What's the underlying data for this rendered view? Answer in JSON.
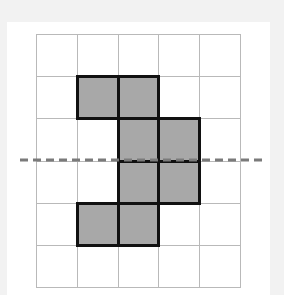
{
  "diagram": {
    "type": "grid-figure-with-symmetry-line",
    "grid": {
      "rows": 6,
      "cols": 5,
      "left": 36,
      "top": 34,
      "cell_width": 40.8,
      "cell_height": 42.2,
      "line_color": "#b9b9b9"
    },
    "shaded_cells": [
      {
        "row": 1,
        "col": 1
      },
      {
        "row": 1,
        "col": 2
      },
      {
        "row": 2,
        "col": 2
      },
      {
        "row": 2,
        "col": 3
      },
      {
        "row": 3,
        "col": 2
      },
      {
        "row": 3,
        "col": 3
      },
      {
        "row": 4,
        "col": 1
      },
      {
        "row": 4,
        "col": 2
      }
    ],
    "shade_color": "#a8a8a8",
    "outline_color": "#111111",
    "dashed_line": {
      "orientation": "horizontal",
      "between_rows": [
        2,
        3
      ],
      "y": 160,
      "x_start": 20,
      "x_end": 262,
      "color": "#7a7a7a"
    }
  }
}
